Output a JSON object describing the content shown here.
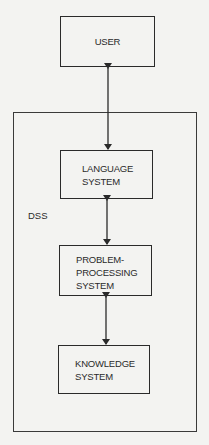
{
  "diagram": {
    "nodes": {
      "user": {
        "label": "USER"
      },
      "language": {
        "label": "LANGUAGE\nSYSTEM"
      },
      "problem": {
        "label": "PROBLEM-\nPROCESSING\nSYSTEM"
      },
      "knowledge": {
        "label": "KNOWLEDGE\nSYSTEM"
      }
    },
    "container": {
      "label": "DSS"
    },
    "edges": [
      {
        "from": "USER",
        "to": "LANGUAGE SYSTEM",
        "type": "bidirectional"
      },
      {
        "from": "LANGUAGE SYSTEM",
        "to": "PROBLEM-PROCESSING SYSTEM",
        "type": "bidirectional"
      },
      {
        "from": "PROBLEM-PROCESSING SYSTEM",
        "to": "KNOWLEDGE SYSTEM",
        "type": "bidirectional"
      }
    ],
    "colors": {
      "line": "#2a2a2a",
      "background": "#f3f3f1"
    }
  }
}
